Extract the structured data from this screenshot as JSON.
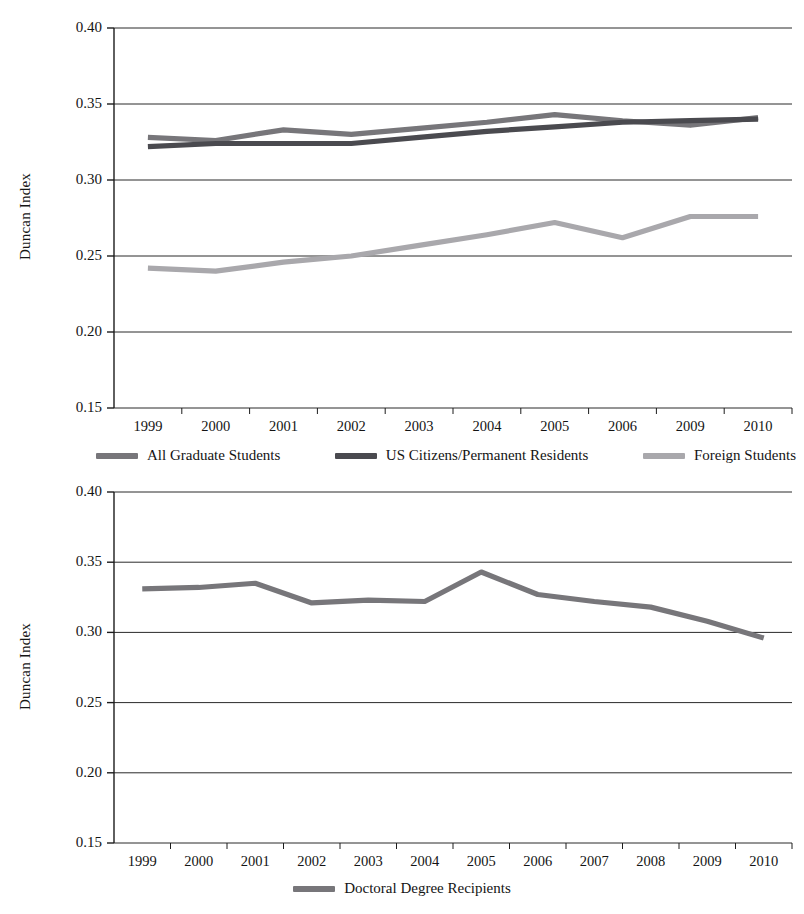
{
  "figure": {
    "background": "#ffffff",
    "axis_color": "#1c1c1c",
    "grid_color": "#2a2a2a"
  },
  "charts": [
    {
      "id": "chart-top",
      "y_axis_label": "Duncan Index",
      "y_ticks": [
        "0.40",
        "0.35",
        "0.30",
        "0.25",
        "0.20",
        "0.15"
      ],
      "x_ticks": [
        "1999",
        "2000",
        "2001",
        "2002",
        "2003",
        "2004",
        "2005",
        "2006",
        "2009",
        "2010"
      ],
      "legend": [
        {
          "label": "All Graduate Students",
          "color": "#77767a",
          "swatch": "legend-swatch-all-graduate-students"
        },
        {
          "label": "US Citizens/Permanent Residents",
          "color": "#4a4a4f",
          "swatch": "legend-swatch-us-citizens"
        },
        {
          "label": "Foreign Students",
          "color": "#a9a8ac",
          "swatch": "legend-swatch-foreign-students"
        }
      ]
    },
    {
      "id": "chart-bottom",
      "y_axis_label": "Duncan Index",
      "y_ticks": [
        "0.40",
        "0.35",
        "0.30",
        "0.25",
        "0.20",
        "0.15"
      ],
      "x_ticks": [
        "1999",
        "2000",
        "2001",
        "2002",
        "2003",
        "2004",
        "2005",
        "2006",
        "2007",
        "2008",
        "2009",
        "2010"
      ],
      "legend": [
        {
          "label": "Doctoral Degree Recipients",
          "color": "#77767a",
          "swatch": "legend-swatch-doctoral-degree-recipients"
        }
      ]
    }
  ],
  "chart_data": [
    {
      "type": "line",
      "title": "",
      "xlabel": "",
      "ylabel": "Duncan Index",
      "ylim": [
        0.15,
        0.4
      ],
      "ytick_step": 0.05,
      "grid": true,
      "legend_position": "bottom",
      "categories": [
        "1999",
        "2000",
        "2001",
        "2002",
        "2003",
        "2004",
        "2005",
        "2006",
        "2009",
        "2010"
      ],
      "series": [
        {
          "name": "All Graduate Students",
          "color": "#77767a",
          "values": [
            0.328,
            0.326,
            0.333,
            0.33,
            0.334,
            0.338,
            0.343,
            0.339,
            0.336,
            0.341
          ]
        },
        {
          "name": "US Citizens/Permanent Residents",
          "color": "#4a4a4f",
          "values": [
            0.322,
            0.324,
            0.324,
            0.324,
            0.328,
            0.332,
            0.335,
            0.338,
            0.339,
            0.34
          ]
        },
        {
          "name": "Foreign Students",
          "color": "#a9a8ac",
          "values": [
            0.242,
            0.24,
            0.246,
            0.25,
            0.257,
            0.264,
            0.272,
            0.262,
            0.276,
            0.276
          ]
        }
      ]
    },
    {
      "type": "line",
      "title": "",
      "xlabel": "",
      "ylabel": "Duncan Index",
      "ylim": [
        0.15,
        0.4
      ],
      "ytick_step": 0.05,
      "grid": true,
      "legend_position": "bottom",
      "categories": [
        "1999",
        "2000",
        "2001",
        "2002",
        "2003",
        "2004",
        "2005",
        "2006",
        "2007",
        "2008",
        "2009",
        "2010"
      ],
      "series": [
        {
          "name": "Doctoral Degree Recipients",
          "color": "#77767a",
          "values": [
            0.331,
            0.332,
            0.335,
            0.321,
            0.323,
            0.322,
            0.343,
            0.327,
            0.322,
            0.318,
            0.308,
            0.296
          ]
        }
      ]
    }
  ]
}
